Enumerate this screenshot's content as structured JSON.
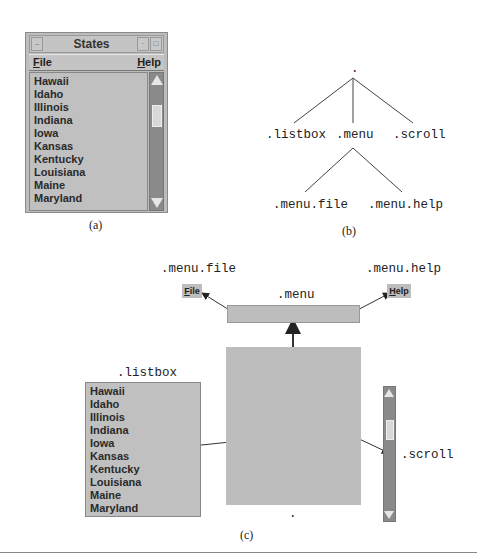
{
  "panel_a": {
    "caption": "(a)",
    "window": {
      "title": "States",
      "title_buttons": [
        "minimize-icon",
        "maximize-icon",
        "close-icon"
      ],
      "menu": [
        {
          "label": "File",
          "mnemonic": "F"
        },
        {
          "label": "Help",
          "mnemonic": "H"
        }
      ],
      "listbox_items": [
        "Hawaii",
        "Idaho",
        "Illinois",
        "Indiana",
        "Iowa",
        "Kansas",
        "Kentucky",
        "Louisiana",
        "Maine",
        "Maryland"
      ],
      "scrollbar": {
        "up_arrow": "▲",
        "down_arrow": "▼"
      }
    }
  },
  "panel_b": {
    "caption": "(b)",
    "tree": {
      "root": ".",
      "children": [
        {
          "label": ".listbox"
        },
        {
          "label": ".menu",
          "children": [
            {
              "label": ".menu.file"
            },
            {
              "label": ".menu.help"
            }
          ]
        },
        {
          "label": ".scroll"
        }
      ]
    }
  },
  "panel_c": {
    "caption": "(c)",
    "labels": {
      "menu_file": ".menu.file",
      "menu_help": ".menu.help",
      "menu": ".menu",
      "listbox": ".listbox",
      "scroll": ".scroll",
      "root_dot": "."
    },
    "file_button": "File",
    "help_button": "Help",
    "listbox_items": [
      "Hawaii",
      "Idaho",
      "Illinois",
      "Indiana",
      "Iowa",
      "Kansas",
      "Kentucky",
      "Louisiana",
      "Maine",
      "Maryland"
    ]
  },
  "colors": {
    "widget_gray": "#bdbdbd",
    "scroll_track": "#8a8a8a",
    "line": "#333333"
  }
}
